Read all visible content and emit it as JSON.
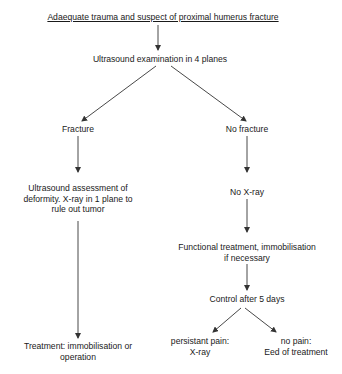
{
  "diagram": {
    "type": "flowchart",
    "nodes": {
      "start": {
        "text": "Adaequate trauma and suspect of proximal humerus fracture"
      },
      "ultrasound": {
        "text": "Ultrasound examination in 4 planes"
      },
      "fracture": {
        "text": "Fracture"
      },
      "no_fracture": {
        "text": "No fracture"
      },
      "assessment": {
        "line1": "Ultrasound assessment of",
        "line2": "deformity. X-ray in 1 plane to",
        "line3": "rule out tumor"
      },
      "no_xray": {
        "text": "No X-ray"
      },
      "functional": {
        "line1": "Functional treatment, immobilisation",
        "line2": "if necessary"
      },
      "control": {
        "text": "Control after 5 days"
      },
      "treatment": {
        "line1": "Treatment: immobilisation or",
        "line2": "operation"
      },
      "persistant": {
        "line1": "persistant pain:",
        "line2": "X-ray"
      },
      "no_pain": {
        "line1": "no pain:",
        "line2": "Eed of treatment"
      }
    },
    "edges": [
      [
        "start",
        "ultrasound"
      ],
      [
        "ultrasound",
        "fracture"
      ],
      [
        "ultrasound",
        "no_fracture"
      ],
      [
        "fracture",
        "assessment"
      ],
      [
        "assessment",
        "treatment"
      ],
      [
        "no_fracture",
        "no_xray"
      ],
      [
        "no_xray",
        "functional"
      ],
      [
        "functional",
        "control"
      ],
      [
        "control",
        "persistant"
      ],
      [
        "control",
        "no_pain"
      ]
    ],
    "colors": {
      "line": "#333333",
      "text": "#1a1a1a",
      "background": "#ffffff"
    }
  }
}
